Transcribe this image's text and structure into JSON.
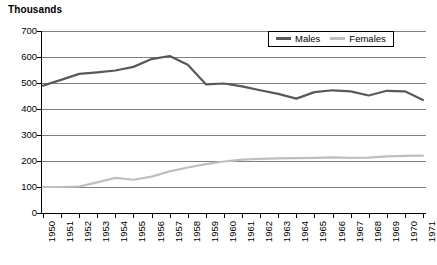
{
  "chart_data": {
    "type": "line",
    "title": "Thousands",
    "xlabel": "",
    "ylabel": "",
    "ylim": [
      0,
      700
    ],
    "ytick_step": 100,
    "grid": true,
    "legend_position": "top-right",
    "yticks": [
      "700",
      "600",
      "500",
      "400",
      "300",
      "200",
      "100",
      "0"
    ],
    "categories": [
      "1950",
      "1951",
      "1952",
      "1953",
      "1954",
      "1955",
      "1956",
      "1957",
      "1958",
      "1959",
      "1960",
      "1961",
      "1962",
      "1963",
      "1964",
      "1965",
      "1966",
      "1967",
      "1968",
      "1969",
      "1970",
      "1971"
    ],
    "series": [
      {
        "name": "Males",
        "color": "#595959",
        "values": [
          490,
          512,
          535,
          541,
          548,
          562,
          592,
          604,
          570,
          495,
          498,
          487,
          472,
          458,
          440,
          465,
          472,
          468,
          452,
          470,
          468,
          435
        ]
      },
      {
        "name": "Females",
        "color": "#BFBFBF",
        "values": [
          100,
          100,
          102,
          118,
          135,
          128,
          140,
          160,
          175,
          188,
          198,
          205,
          208,
          210,
          211,
          212,
          214,
          212,
          213,
          218,
          220,
          221
        ]
      }
    ]
  },
  "legend": {
    "entries": [
      {
        "label": "Males"
      },
      {
        "label": "Females"
      }
    ]
  },
  "colors": {
    "males": "#595959",
    "females": "#BFBFBF",
    "gridline": "#808080",
    "axis": "#000000",
    "background": "#ffffff"
  }
}
